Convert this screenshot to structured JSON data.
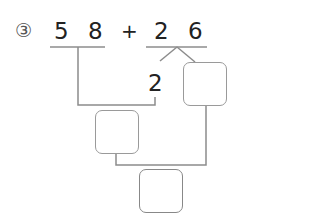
{
  "problem": {
    "number_label": "③",
    "first_number": {
      "tens": "5",
      "ones": "8"
    },
    "operator": "+",
    "second_number": {
      "tens": "2",
      "ones": "6"
    },
    "decomposition_given": "2",
    "answer_boxes": [
      {
        "id": "split-remainder",
        "value": ""
      },
      {
        "id": "partial-sum",
        "value": ""
      },
      {
        "id": "final-sum",
        "value": ""
      }
    ]
  },
  "colors": {
    "line": "#8c8c8c",
    "box_border": "#9a9a9a",
    "text": "#222222"
  }
}
